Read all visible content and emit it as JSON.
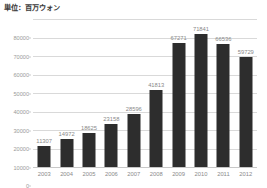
{
  "chart_data": {
    "type": "bar",
    "title": "単位：百万ウォン",
    "xlabel": "",
    "ylabel": "",
    "categories": [
      "2003",
      "2004",
      "2005",
      "2006",
      "2007",
      "2008",
      "2009",
      "2010",
      "2011",
      "2012"
    ],
    "values": [
      11307,
      14972,
      18625,
      23158,
      28596,
      41813,
      67271,
      71841,
      66536,
      59729
    ],
    "value_labels": [
      "11307",
      "14972",
      "18625",
      "23158",
      "28596",
      "41813",
      "67271",
      "71841",
      "66536",
      "59729"
    ],
    "ylim": [
      0,
      80000
    ],
    "ytick_values": [
      0,
      10000,
      20000,
      30000,
      40000,
      50000,
      60000,
      70000,
      80000
    ],
    "ytick_labels": [
      "0",
      "10000",
      "20000",
      "30000",
      "40000",
      "50000",
      "60000",
      "70000",
      "80000"
    ],
    "grid": "horizontal",
    "legend": "none",
    "bar_color": "#2d2d2d",
    "gridline_color": "#d9d9d9",
    "label_color": "#8a8a8a",
    "background_color": "#ffffff"
  }
}
